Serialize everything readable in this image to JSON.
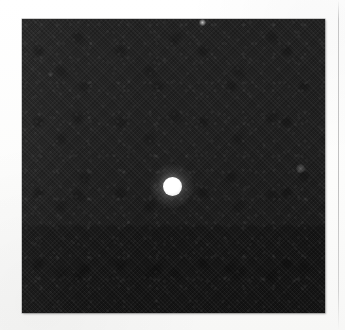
{
  "figure": {
    "medium": "scanned-halftone-print",
    "background_color": "#fdfdfc",
    "caption": "",
    "title": ""
  },
  "frame": {
    "name": "dark-field-image",
    "x": 22,
    "y": 19,
    "width": 303,
    "height": 294,
    "fill_color": "#161616",
    "border_color": "#5a5a5a",
    "texture": "diagonal halftone grain",
    "tonal_seam_y": 224
  },
  "features": [
    {
      "id": "bright-spot",
      "label": "bright source",
      "shape": "round",
      "center_x": 172,
      "center_y": 186,
      "core_radius": 9,
      "halo_radius": 22,
      "color": "#ffffff",
      "relative_brightness": 1.0
    },
    {
      "id": "speck-top",
      "label": "faint speck",
      "shape": "round",
      "center_x": 202,
      "center_y": 22,
      "core_radius": 2,
      "halo_radius": 3,
      "color": "#ffffff",
      "relative_brightness": 0.34
    },
    {
      "id": "speck-right",
      "label": "faint speck",
      "shape": "round",
      "center_x": 300,
      "center_y": 168,
      "core_radius": 2,
      "halo_radius": 4,
      "color": "#ffffff",
      "relative_brightness": 0.13
    },
    {
      "id": "speck-left",
      "label": "faint speck",
      "shape": "round",
      "center_x": 50,
      "center_y": 74,
      "core_radius": 1,
      "halo_radius": 2,
      "color": "#ffffff",
      "relative_brightness": 0.08
    }
  ],
  "margin_rule": {
    "label": "page rule",
    "orientation": "vertical",
    "x": 338,
    "color": "#78787a"
  }
}
